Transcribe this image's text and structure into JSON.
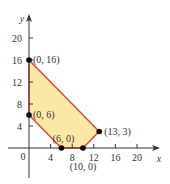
{
  "chart_data": {
    "type": "area",
    "title": "",
    "xlabel": "x",
    "ylabel": "y",
    "xlim": [
      0,
      22
    ],
    "ylim": [
      0,
      22
    ],
    "grid": false,
    "x_ticks": [
      4,
      8,
      12,
      16,
      20
    ],
    "y_ticks": [
      4,
      8,
      12,
      16,
      20
    ],
    "origin_label": "0",
    "feasible_region": {
      "vertices": [
        [
          0,
          16
        ],
        [
          0,
          6
        ],
        [
          6,
          0
        ],
        [
          10,
          0
        ],
        [
          13,
          3
        ]
      ],
      "fill_color": "#fbe7a6",
      "edge_color": "#d9433a"
    },
    "points": [
      {
        "x": 0,
        "y": 16,
        "label": "(0, 16)"
      },
      {
        "x": 0,
        "y": 6,
        "label": "(0, 6)"
      },
      {
        "x": 6,
        "y": 0,
        "label": "(6, 0)"
      },
      {
        "x": 10,
        "y": 0,
        "label": "(10, 0)"
      },
      {
        "x": 13,
        "y": 3,
        "label": "(13, 3)"
      }
    ]
  },
  "colors": {
    "axis": "#333333",
    "region_fill": "#fbe7a6",
    "region_edge": "#d9433a",
    "point": "#000000"
  }
}
